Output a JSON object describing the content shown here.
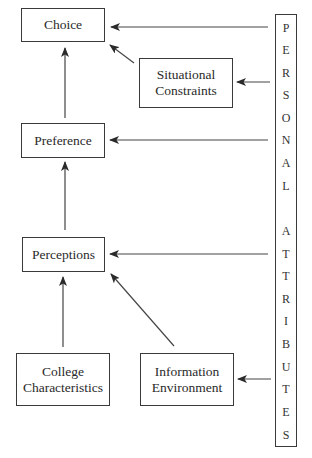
{
  "diagram": {
    "type": "flow-model",
    "nodes": {
      "choice": {
        "label": "Choice"
      },
      "situational_constraints": {
        "label": "Situational\nConstraints"
      },
      "preference": {
        "label": "Preference"
      },
      "perceptions": {
        "label": "Perceptions"
      },
      "college_characteristics": {
        "label": "College\nCharacteristics"
      },
      "information_environment": {
        "label": "Information\nEnvironment"
      }
    },
    "personal_attributes": {
      "label": "PERSONAL ATTRIBUTES",
      "letters": [
        "P",
        "E",
        "R",
        "S",
        "O",
        "N",
        "A",
        "L",
        "",
        "A",
        "T",
        "T",
        "R",
        "I",
        "B",
        "U",
        "T",
        "E",
        "S"
      ]
    },
    "edges": [
      {
        "from": "preference",
        "to": "choice"
      },
      {
        "from": "situational_constraints",
        "to": "choice"
      },
      {
        "from": "personal_attributes",
        "to": "choice"
      },
      {
        "from": "personal_attributes",
        "to": "situational_constraints"
      },
      {
        "from": "perceptions",
        "to": "preference"
      },
      {
        "from": "personal_attributes",
        "to": "preference"
      },
      {
        "from": "personal_attributes",
        "to": "perceptions"
      },
      {
        "from": "college_characteristics",
        "to": "perceptions"
      },
      {
        "from": "information_environment",
        "to": "perceptions"
      },
      {
        "from": "personal_attributes",
        "to": "information_environment"
      }
    ],
    "colors": {
      "line": "#3a3a3a",
      "text": "#2a2a2a",
      "background": "#ffffff"
    }
  }
}
